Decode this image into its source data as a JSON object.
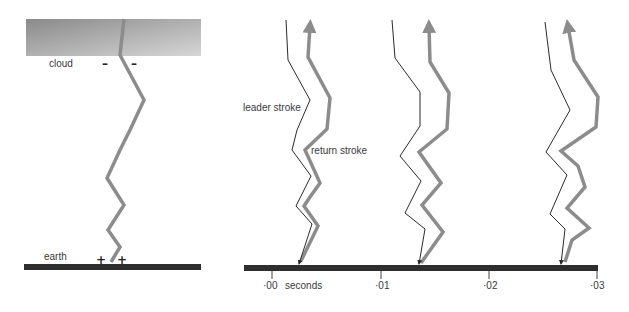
{
  "left_panel": {
    "cloud_label": "cloud",
    "earth_label": "earth",
    "cloud_charges": [
      "–",
      "–"
    ],
    "earth_charges": [
      "+",
      "+"
    ]
  },
  "right_panel": {
    "leader_label": "leader stroke",
    "return_label": "return stroke",
    "axis": {
      "unit_label": "seconds",
      "ticks": [
        "·00",
        "·01",
        "·02",
        "·03"
      ]
    }
  },
  "colors": {
    "cloud_dark": "#8a8a8a",
    "cloud_light": "#cfcfcf",
    "ground": "#2e2e2e",
    "return_stroke": "#8c8c8c",
    "leader_stroke": "#2a2a2a",
    "text": "#3a3a3a"
  }
}
